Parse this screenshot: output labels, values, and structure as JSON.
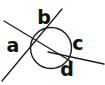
{
  "figure": {
    "canvas": {
      "width": 105,
      "height": 85
    },
    "background_color": "#ffffff",
    "stroke_color": "#1a1a1a",
    "label_color": "#111111",
    "circle": {
      "cx": 51,
      "cy": 48,
      "r": 20.5,
      "stroke_width": 1.4,
      "fill": "none"
    },
    "lines": [
      {
        "name": "line-upper-left-to-lower-right",
        "x1": 4,
        "y1": 21,
        "x2": 72,
        "y2": 62,
        "stroke_width": 1.3
      },
      {
        "name": "line-upper-right-to-lower-left",
        "x1": 62,
        "y1": 9,
        "x2": 2,
        "y2": 81,
        "stroke_width": 1.3
      },
      {
        "name": "line-center-to-right-edge",
        "x1": 48,
        "y1": 52,
        "x2": 104,
        "y2": 64,
        "stroke_width": 1.3
      }
    ],
    "intersection": {
      "x": 49,
      "y": 51
    },
    "labels": [
      {
        "id": "a",
        "text": "a",
        "x": 13,
        "y": 46,
        "position": "left"
      },
      {
        "id": "b",
        "text": "b",
        "x": 44,
        "y": 18,
        "position": "top"
      },
      {
        "id": "c",
        "text": "c",
        "x": 78,
        "y": 44,
        "position": "right"
      },
      {
        "id": "d",
        "text": "d",
        "x": 67,
        "y": 70,
        "position": "bottom"
      }
    ]
  }
}
